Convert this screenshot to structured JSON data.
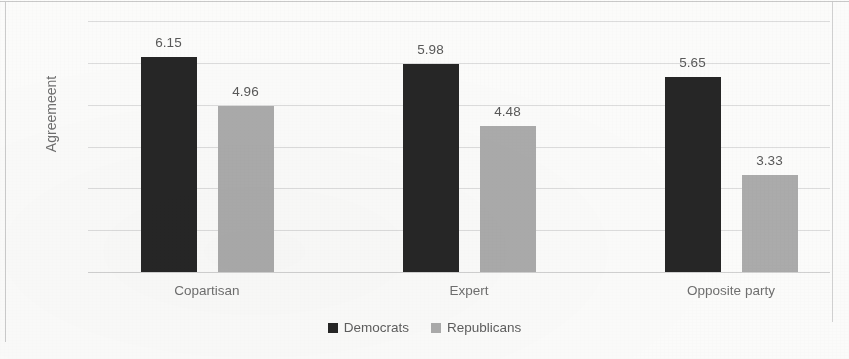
{
  "chart_data": {
    "type": "bar",
    "title": "",
    "xlabel": "",
    "ylabel": "Agreemeent",
    "ylim": [
      1,
      7
    ],
    "yticks": [
      "7",
      "6",
      "5",
      "4",
      "3",
      "2",
      "1"
    ],
    "grid": true,
    "legend_position": "bottom",
    "categories": [
      "Copartisan",
      "Expert",
      "Opposite party"
    ],
    "series": [
      {
        "name": "Democrats",
        "color": "#262626",
        "values": [
          6.15,
          5.98,
          5.65
        ],
        "labels": [
          "6.15",
          "5.98",
          "5.65"
        ]
      },
      {
        "name": "Republicans",
        "color": "#ababab",
        "values": [
          4.96,
          4.48,
          3.33
        ],
        "labels": [
          "4.96",
          "4.48",
          "3.33"
        ]
      }
    ]
  }
}
